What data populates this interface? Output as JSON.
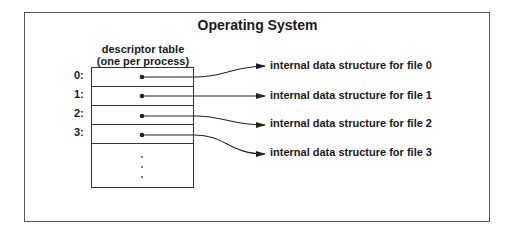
{
  "diagram": {
    "title": "Operating System",
    "table_caption_line1": "descriptor table",
    "table_caption_line2": "(one per process)",
    "entries": [
      {
        "index": "0:",
        "label": "internal data structure for file 0"
      },
      {
        "index": "1:",
        "label": "internal data structure for file 1"
      },
      {
        "index": "2:",
        "label": "internal data structure for file 2"
      },
      {
        "index": "3:",
        "label": "internal data structure for file 3"
      }
    ],
    "ellipsis": "⋮"
  }
}
